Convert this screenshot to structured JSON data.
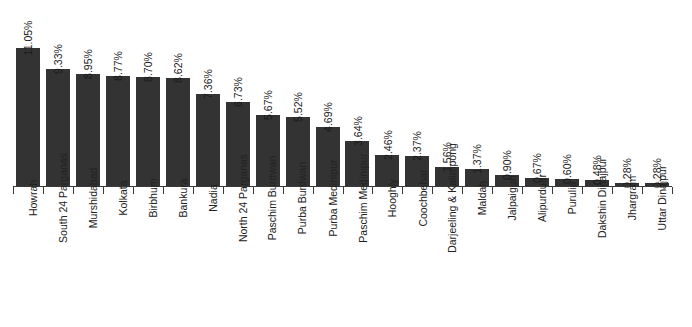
{
  "chart_data": {
    "type": "bar",
    "title": "",
    "subtitle": "",
    "xlabel": "",
    "ylabel": "",
    "grid": false,
    "legend": null,
    "axis_range": [
      0,
      11.05
    ],
    "label_rotation": -90,
    "bar_color": "#333333",
    "axis_color": "#3a3a3a",
    "categories": [
      "Howrah",
      "South 24 Parganas",
      "Murshidabad",
      "Kolkata",
      "Birbhum",
      "Bankura",
      "Nadia",
      "North 24 Parganas",
      "Paschim Burdwan",
      "Purba Burdwan",
      "Purba Medinipur",
      "Paschim Medinipur",
      "Hooghly",
      "Coochbehar",
      "Darjeeling & Kalimpong",
      "Maldah",
      "Jalpaiguri",
      "Alipurduar",
      "Purulia",
      "Dakshin Dinajpur",
      "Jhargram",
      "Uttar Dinajpur"
    ],
    "values": [
      11.05,
      9.33,
      8.95,
      8.77,
      8.7,
      8.62,
      7.36,
      6.73,
      5.67,
      5.52,
      4.69,
      3.64,
      2.46,
      2.37,
      1.56,
      1.37,
      0.9,
      0.67,
      0.6,
      0.48,
      0.28,
      0.28
    ],
    "value_labels": [
      "11.05%",
      "9.33%",
      "8.95%",
      "8.77%",
      "8.70%",
      "8.62%",
      "7.36%",
      "6.73%",
      "5.67%",
      "5.52%",
      "4.69%",
      "3.64%",
      "2.46%",
      "2.37%",
      "1.56%",
      "1.37%",
      "0.90%",
      "0.67%",
      "0.60%",
      "0.48%",
      "0.28%",
      "0.28%"
    ]
  }
}
